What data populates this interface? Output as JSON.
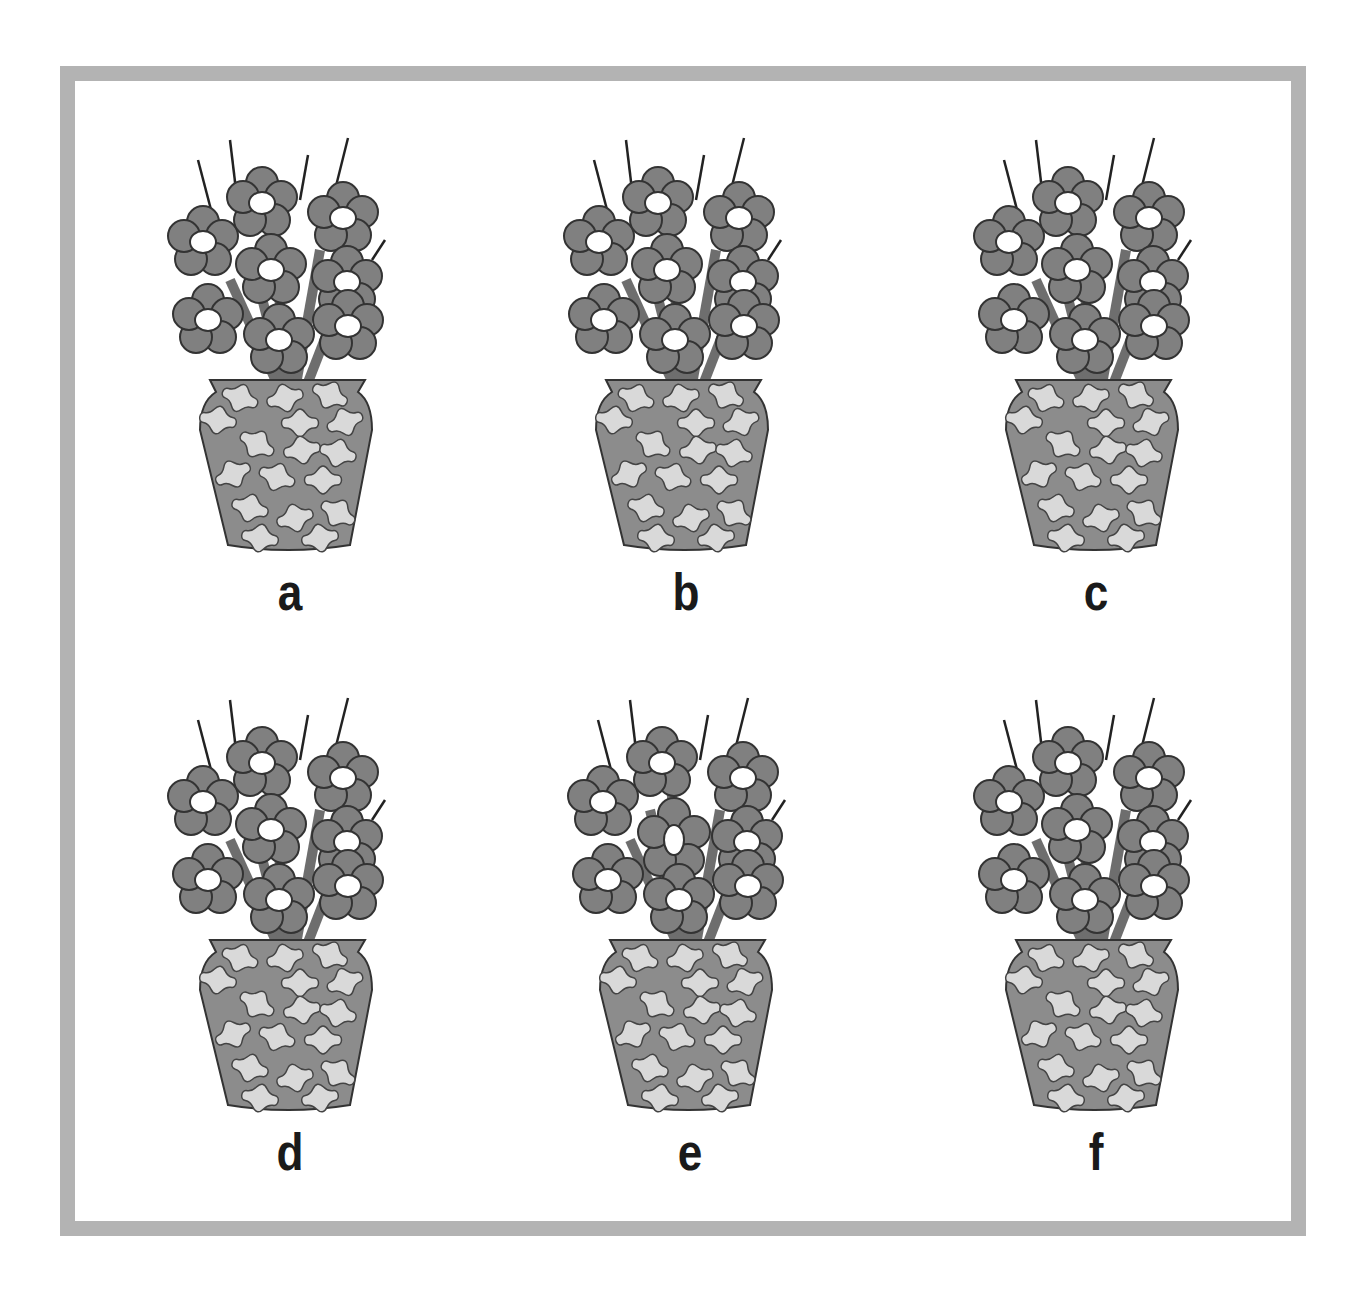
{
  "puzzle": {
    "type": "spot-the-difference",
    "frame_color": "#b3b3b3",
    "flower_color": "#808080",
    "flower_center_color": "#ffffff",
    "vase_color": "#8c8c8c",
    "vase_pattern_color": "#d9d9d9",
    "outline_color": "#333333",
    "options": [
      {
        "label": "a",
        "variant": "base"
      },
      {
        "label": "b",
        "variant": "base"
      },
      {
        "label": "c",
        "variant": "base"
      },
      {
        "label": "d",
        "variant": "base"
      },
      {
        "label": "e",
        "variant": "oval-center-flower"
      },
      {
        "label": "f",
        "variant": "base"
      }
    ]
  }
}
